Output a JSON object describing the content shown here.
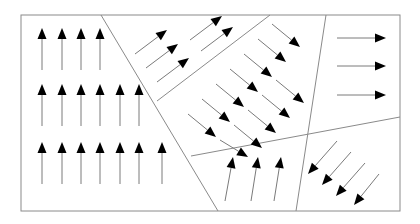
{
  "diagram": {
    "frame": {
      "x1": 21,
      "y1": 15,
      "x2": 400,
      "y2": 211,
      "stroke": "#8a8a8a"
    },
    "boundaries": [
      {
        "id": "left-diagonal",
        "x1": 101,
        "y1": 15,
        "x2": 218,
        "y2": 211
      },
      {
        "id": "ne-strip-edge",
        "x1": 270,
        "y1": 15,
        "x2": 157,
        "y2": 101
      },
      {
        "id": "right-vertical",
        "x1": 326,
        "y1": 15,
        "x2": 296,
        "y2": 211
      },
      {
        "id": "lower-horizontal",
        "x1": 191,
        "y1": 156,
        "x2": 400,
        "y2": 117
      }
    ],
    "regions": [
      {
        "id": "left-region",
        "direction": "up",
        "arrows": [
          {
            "x1": 42,
            "y1": 70,
            "x2": 42,
            "y2": 28
          },
          {
            "x1": 62,
            "y1": 70,
            "x2": 62,
            "y2": 28
          },
          {
            "x1": 81,
            "y1": 70,
            "x2": 81,
            "y2": 28
          },
          {
            "x1": 100,
            "y1": 70,
            "x2": 100,
            "y2": 28
          },
          {
            "x1": 42,
            "y1": 126,
            "x2": 42,
            "y2": 84
          },
          {
            "x1": 62,
            "y1": 126,
            "x2": 62,
            "y2": 84
          },
          {
            "x1": 81,
            "y1": 126,
            "x2": 81,
            "y2": 84
          },
          {
            "x1": 100,
            "y1": 126,
            "x2": 100,
            "y2": 84
          },
          {
            "x1": 120,
            "y1": 126,
            "x2": 120,
            "y2": 84
          },
          {
            "x1": 139,
            "y1": 126,
            "x2": 139,
            "y2": 84
          },
          {
            "x1": 42,
            "y1": 184,
            "x2": 42,
            "y2": 142
          },
          {
            "x1": 62,
            "y1": 184,
            "x2": 62,
            "y2": 142
          },
          {
            "x1": 81,
            "y1": 184,
            "x2": 81,
            "y2": 142
          },
          {
            "x1": 100,
            "y1": 184,
            "x2": 100,
            "y2": 142
          },
          {
            "x1": 120,
            "y1": 184,
            "x2": 120,
            "y2": 142
          },
          {
            "x1": 139,
            "y1": 184,
            "x2": 139,
            "y2": 142
          },
          {
            "x1": 162,
            "y1": 184,
            "x2": 162,
            "y2": 142
          }
        ]
      },
      {
        "id": "ne-strip-region",
        "direction": "up-right",
        "arrows": [
          {
            "x1": 135,
            "y1": 54,
            "x2": 167,
            "y2": 30
          },
          {
            "x1": 146,
            "y1": 68,
            "x2": 178,
            "y2": 44
          },
          {
            "x1": 157,
            "y1": 82,
            "x2": 189,
            "y2": 58
          },
          {
            "x1": 190,
            "y1": 40,
            "x2": 222,
            "y2": 16
          },
          {
            "x1": 201,
            "y1": 51,
            "x2": 233,
            "y2": 27
          }
        ]
      },
      {
        "id": "center-region",
        "direction": "down-right",
        "arrows": [
          {
            "x1": 272,
            "y1": 24,
            "x2": 300,
            "y2": 47
          },
          {
            "x1": 258,
            "y1": 39,
            "x2": 286,
            "y2": 62
          },
          {
            "x1": 244,
            "y1": 54,
            "x2": 272,
            "y2": 77
          },
          {
            "x1": 230,
            "y1": 69,
            "x2": 258,
            "y2": 92
          },
          {
            "x1": 216,
            "y1": 84,
            "x2": 244,
            "y2": 107
          },
          {
            "x1": 202,
            "y1": 99,
            "x2": 230,
            "y2": 122
          },
          {
            "x1": 188,
            "y1": 114,
            "x2": 216,
            "y2": 137
          },
          {
            "x1": 276,
            "y1": 80,
            "x2": 304,
            "y2": 103
          },
          {
            "x1": 262,
            "y1": 95,
            "x2": 290,
            "y2": 118
          },
          {
            "x1": 248,
            "y1": 110,
            "x2": 276,
            "y2": 133
          },
          {
            "x1": 234,
            "y1": 125,
            "x2": 262,
            "y2": 148
          },
          {
            "x1": 220,
            "y1": 140,
            "x2": 248,
            "y2": 157
          }
        ]
      },
      {
        "id": "right-top-region",
        "direction": "right",
        "arrows": [
          {
            "x1": 337,
            "y1": 38,
            "x2": 386,
            "y2": 38
          },
          {
            "x1": 337,
            "y1": 66,
            "x2": 386,
            "y2": 66
          },
          {
            "x1": 337,
            "y1": 95,
            "x2": 386,
            "y2": 95
          }
        ]
      },
      {
        "id": "bottom-middle-region",
        "direction": "up",
        "arrows": [
          {
            "x1": 225,
            "y1": 201,
            "x2": 233,
            "y2": 157
          },
          {
            "x1": 251,
            "y1": 201,
            "x2": 258,
            "y2": 157
          },
          {
            "x1": 274,
            "y1": 201,
            "x2": 281,
            "y2": 157
          }
        ]
      },
      {
        "id": "bottom-right-region",
        "direction": "down-left",
        "arrows": [
          {
            "x1": 337,
            "y1": 141,
            "x2": 308,
            "y2": 174
          },
          {
            "x1": 351,
            "y1": 152,
            "x2": 322,
            "y2": 185
          },
          {
            "x1": 365,
            "y1": 163,
            "x2": 336,
            "y2": 196
          },
          {
            "x1": 379,
            "y1": 174,
            "x2": 354,
            "y2": 205
          }
        ]
      }
    ],
    "colors": {
      "line": "#8a8a8a",
      "arrow_shaft": "#7a7a7a",
      "arrow_head": "#000000",
      "background": "#ffffff"
    }
  }
}
